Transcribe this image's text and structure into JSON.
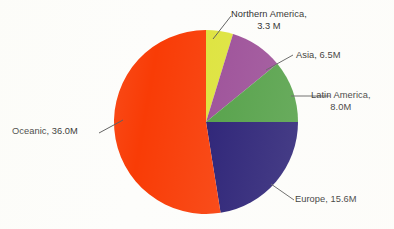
{
  "chart_data": {
    "type": "pie",
    "title": "",
    "subtitle": "",
    "xlabel": "",
    "ylabel": "",
    "unit": "M",
    "legend_position": "none",
    "labels_position": "outside-with-leader-lines",
    "grid": false,
    "start_angle_deg": 0,
    "direction": "clockwise",
    "total": 69.4,
    "categories": [
      "Northern America",
      "Asia",
      "Latin America",
      "Europe",
      "Oceanic"
    ],
    "values": [
      3.3,
      6.5,
      8.0,
      15.6,
      36.0
    ],
    "colors": [
      "#dde33a",
      "#9a4b96",
      "#4f9e43",
      "#241a72",
      "#f93c06"
    ],
    "slices": [
      {
        "name": "Northern America",
        "value": 3.3,
        "value_text": "3.3 M",
        "label_line1": "Northern America,",
        "label_line2": "3.3 M",
        "color": "#dde33a",
        "start_deg": 0.0,
        "end_deg": 17.1,
        "percent": 4.8
      },
      {
        "name": "Asia",
        "value": 6.5,
        "value_text": "6.5M",
        "label_line1": "Asia, 6.5M",
        "label_line2": "",
        "color": "#9a4b96",
        "start_deg": 17.1,
        "end_deg": 50.8,
        "percent": 9.4
      },
      {
        "name": "Latin America",
        "value": 8.0,
        "value_text": "8.0M",
        "label_line1": "Latin America,",
        "label_line2": "8.0M",
        "color": "#4f9e43",
        "start_deg": 50.8,
        "end_deg": 90.0,
        "percent": 11.5
      },
      {
        "name": "Europe",
        "value": 15.6,
        "value_text": "15.6M",
        "label_line1": "Europe, 15.6M",
        "label_line2": "",
        "color": "#241a72",
        "start_deg": 90.0,
        "end_deg": 170.9,
        "percent": 22.5
      },
      {
        "name": "Oceanic",
        "value": 36.0,
        "value_text": "36.0M",
        "label_line1": "Oceanic, 36.0M",
        "label_line2": "",
        "color": "#f93c06",
        "start_deg": 170.9,
        "end_deg": 360.0,
        "percent": 51.9
      }
    ]
  },
  "geometry": {
    "center_x": 206,
    "center_y": 122,
    "radius": 92
  }
}
